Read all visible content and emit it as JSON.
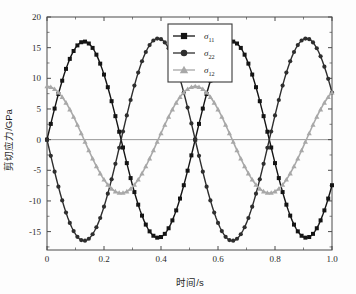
{
  "chart_data": {
    "type": "line",
    "title": "",
    "xlabel": "时间/s",
    "ylabel": "剪切应力/GPa",
    "xlim": [
      0,
      1.0
    ],
    "ylim": [
      -18,
      20
    ],
    "xticks": [
      "0",
      "0.2",
      "0.4",
      "0.6",
      "0.8",
      "1.0"
    ],
    "xtick_values": [
      0,
      0.2,
      0.4,
      0.6,
      0.8,
      1.0
    ],
    "yticks": [
      "20",
      "15",
      "10",
      "5",
      "0",
      "-5",
      "-10",
      "-15"
    ],
    "ytick_values": [
      20,
      15,
      10,
      5,
      0,
      -5,
      -10,
      -15
    ],
    "grid": false,
    "zero_line": true,
    "legend_position": "top-center",
    "period": 0.52,
    "series": [
      {
        "name": "σ_11",
        "label": "σ",
        "subscript": "11",
        "color": "#141414",
        "marker": "square",
        "amplitude": 16.0,
        "phase": 0.0,
        "offset": 0.0,
        "values": [
          0.0,
          0.35,
          1.4,
          3.1,
          5.2,
          7.6,
          9.9,
          12.0,
          13.8,
          15.1,
          15.9,
          16.0,
          15.7,
          14.9,
          13.6,
          11.9,
          9.9,
          7.6,
          5.2,
          2.8,
          0.6,
          -0.1,
          0.2,
          1.2,
          2.9,
          5.0,
          7.5,
          9.8,
          11.9,
          13.7,
          15.1,
          15.9,
          16.0,
          15.7,
          14.9,
          13.6,
          11.8,
          9.7,
          7.4,
          5.0,
          2.6
        ]
      },
      {
        "name": "σ_22",
        "label": "σ",
        "subscript": "22",
        "color": "#2e2e2e",
        "marker": "circle",
        "amplitude": 16.5,
        "phase": 0.0,
        "offset": 0.0,
        "values": [
          0.0,
          -0.4,
          -1.5,
          -3.3,
          -5.5,
          -7.9,
          -10.3,
          -12.5,
          -14.3,
          -15.6,
          -16.4,
          -16.5,
          -16.2,
          -15.4,
          -14.1,
          -12.3,
          -10.2,
          -7.9,
          -5.4,
          -2.9,
          -0.6,
          0.1,
          -0.2,
          -1.3,
          -3.0,
          -5.2,
          -7.7,
          -10.1,
          -12.3,
          -14.2,
          -15.6,
          -16.4,
          -16.5,
          -16.2,
          -15.3,
          -14.0,
          -12.2,
          -10.0,
          -7.6,
          -5.1,
          -1.6
        ]
      },
      {
        "name": "σ_12",
        "label": "σ",
        "subscript": "12",
        "color": "#a8a8a8",
        "marker": "triangle",
        "amplitude": 8.7,
        "phase": -0.13,
        "offset": 0.0,
        "values": [
          0.6,
          3.4,
          5.8,
          7.6,
          8.6,
          8.7,
          8.1,
          6.8,
          5.0,
          2.9,
          0.7,
          -1.6,
          -3.7,
          -5.5,
          -7.0,
          -8.0,
          -8.4,
          -8.3,
          -7.6,
          -6.4,
          -4.8,
          -2.8,
          -0.6,
          1.6,
          3.7,
          5.6,
          7.1,
          8.2,
          8.7,
          8.6,
          7.9,
          6.6,
          4.8,
          2.7,
          0.5,
          -1.7,
          -3.8,
          -5.8,
          -7.2,
          -8.1,
          -5.0
        ]
      }
    ]
  },
  "legend": {
    "items": [
      {
        "sigma": "σ",
        "sub": "11",
        "marker": "square-marker-icon",
        "color": "#141414"
      },
      {
        "sigma": "σ",
        "sub": "22",
        "marker": "circle-marker-icon",
        "color": "#2e2e2e"
      },
      {
        "sigma": "σ",
        "sub": "12",
        "marker": "triangle-marker-icon",
        "color": "#a8a8a8"
      }
    ]
  },
  "axes": {
    "x_title": "时间/s",
    "y_title": "剪切应力/GPa",
    "x_tick_labels": [
      "0",
      "0.2",
      "0.4",
      "0.6",
      "0.8",
      "1.0"
    ],
    "y_tick_labels": [
      "20",
      "15",
      "10",
      "5",
      "0",
      "-5",
      "-10",
      "-15"
    ]
  },
  "colors": {
    "frame": "#4a4a4a",
    "background": "#fdfdfd",
    "sigma11": "#141414",
    "sigma22": "#2e2e2e",
    "sigma12": "#a8a8a8",
    "zero_line": "#8c8c8c"
  }
}
